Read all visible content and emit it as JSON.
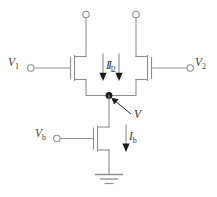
{
  "diagram": {
    "type": "circuit-schematic",
    "colors": {
      "wire": "#8e8e8e",
      "node": "#1a1a1a",
      "label": "#3d3d3d",
      "background": "#ffffff"
    },
    "labels": {
      "v1": "V",
      "v1_sub": "1",
      "v2": "V",
      "v2_sub": "2",
      "vb": "V",
      "vb_sub": "b",
      "i1": "I",
      "i1_sub": "1",
      "i2": "I",
      "i2_sub": "2",
      "ib": "I",
      "ib_sub": "b",
      "v_node": "V"
    },
    "components": [
      {
        "name": "transistor-m1",
        "kind": "nmos",
        "gate_label": "V1",
        "current_label": "I1"
      },
      {
        "name": "transistor-m2",
        "kind": "nmos",
        "gate_label": "V2",
        "current_label": "I2"
      },
      {
        "name": "transistor-mb",
        "kind": "nmos",
        "gate_label": "Vb",
        "current_label": "Ib"
      },
      {
        "name": "ground-symbol",
        "kind": "ground",
        "bars": 3
      },
      {
        "name": "common-source-node",
        "kind": "junction",
        "label": "V"
      },
      {
        "name": "terminal-drain-1",
        "kind": "open-terminal"
      },
      {
        "name": "terminal-drain-2",
        "kind": "open-terminal"
      },
      {
        "name": "terminal-gate-1",
        "kind": "open-terminal"
      },
      {
        "name": "terminal-gate-2",
        "kind": "open-terminal"
      },
      {
        "name": "terminal-gate-b",
        "kind": "open-terminal"
      }
    ]
  }
}
